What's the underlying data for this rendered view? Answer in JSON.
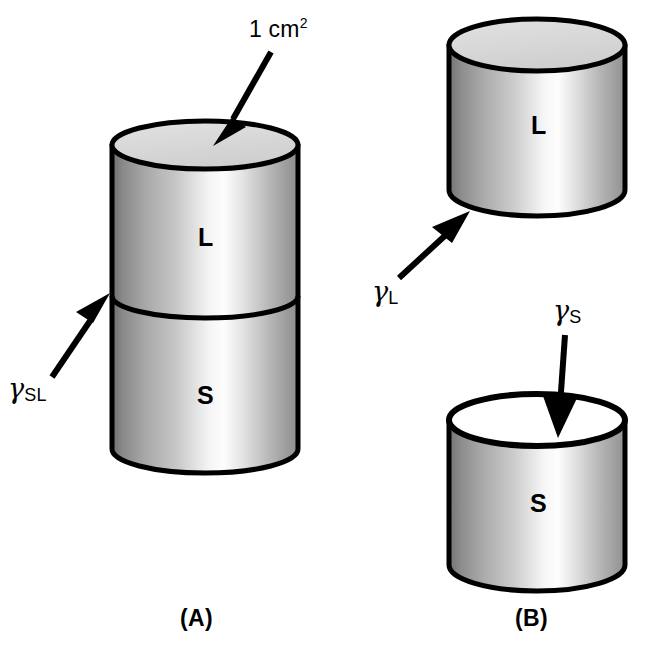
{
  "figure": {
    "type": "diagram",
    "background_color": "#ffffff",
    "ink_color": "#000000"
  },
  "annotations": {
    "area": {
      "text": "1 cm",
      "superscript": "2",
      "target": "top-face-of-combined-cylinder"
    },
    "gamma_sl": {
      "symbol": "γ",
      "subscript": "SL",
      "target": "solid-liquid-interface"
    },
    "gamma_l": {
      "symbol": "γ",
      "subscript": "L",
      "target": "liquid-cylinder-lower-face"
    },
    "gamma_s": {
      "symbol": "γ",
      "subscript": "S",
      "target": "solid-cylinder-top-face"
    }
  },
  "panels": [
    {
      "id": "A",
      "label": "(A)",
      "cylinders": [
        {
          "name": "liquid-section",
          "phase_label": "L",
          "top_face_fill": "#d9d9d9"
        },
        {
          "name": "solid-section",
          "phase_label": "S",
          "top_face_fill": "#d9d9d9"
        }
      ]
    },
    {
      "id": "B",
      "label": "(B)",
      "cylinders": [
        {
          "name": "liquid-cylinder",
          "phase_label": "L",
          "top_face_fill": "#d9d9d9"
        },
        {
          "name": "solid-cylinder",
          "phase_label": "S",
          "top_face_fill": "#ffffff"
        }
      ]
    }
  ],
  "colors": {
    "outline": "#000000",
    "top_face_gray": "#d9d9d9",
    "top_face_white": "#ffffff",
    "body_dark": "#767676",
    "body_mid": "#b4b4b4",
    "body_highlight": "#fdfdfd",
    "body_right": "#9a9a9a"
  }
}
